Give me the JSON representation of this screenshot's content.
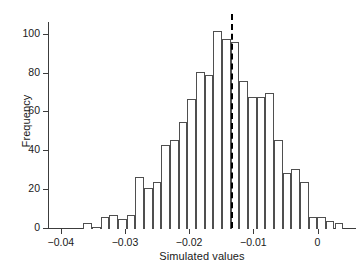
{
  "chart_data": {
    "type": "bar",
    "title": "",
    "subtitle": "",
    "xlabel": "Simulated values",
    "ylabel": "Frequency",
    "xlim": [
      -0.042,
      0.006
    ],
    "ylim": [
      0,
      106
    ],
    "grid": false,
    "legend": null,
    "bin_width": 0.00135,
    "bin_left_edges": [
      -0.0365,
      -0.03515,
      -0.0338,
      -0.03245,
      -0.0311,
      -0.02975,
      -0.0284,
      -0.02705,
      -0.0257,
      -0.02435,
      -0.023,
      -0.02165,
      -0.0203,
      -0.01895,
      -0.0176,
      -0.01625,
      -0.0149,
      -0.01355,
      -0.0122,
      -0.01085,
      -0.0095,
      -0.00815,
      -0.0068,
      -0.00545,
      -0.0041,
      -0.00275,
      -0.0014,
      -5e-05,
      0.0013,
      0.00265
    ],
    "values": [
      3,
      1,
      6,
      7,
      5,
      7,
      27,
      21,
      24,
      43,
      46,
      55,
      67,
      81,
      79,
      102,
      98,
      96,
      76,
      68,
      68,
      70,
      46,
      29,
      31,
      24,
      6,
      6,
      4,
      3
    ],
    "xticks": [
      -0.04,
      -0.03,
      -0.02,
      -0.01,
      0
    ],
    "xtick_labels": [
      "−0.04",
      "−0.03",
      "−0.02",
      "−0.01",
      "0"
    ],
    "yticks": [
      0,
      20,
      40,
      60,
      80,
      100
    ],
    "ytick_labels": [
      "0",
      "20",
      "40",
      "60",
      "80",
      "100"
    ],
    "annotations": [
      {
        "name": "reference-line",
        "type": "vline",
        "x": -0.0135,
        "style": "dashed",
        "color": "#000000"
      }
    ],
    "colors": {
      "bar_fill": "#ffffff",
      "bar_edge": "#4f4f4f",
      "axis": "#3c3c3c",
      "reference_line": "#000000",
      "text": "#1a1a1a"
    }
  },
  "caption": {
    "sliver_text": ""
  }
}
